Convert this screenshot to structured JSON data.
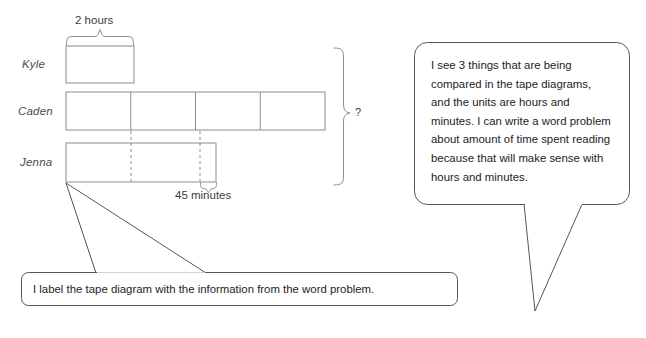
{
  "diagram": {
    "title_hidden": "",
    "rows": [
      {
        "name": "Kyle",
        "label": "Kyle"
      },
      {
        "name": "Caden",
        "label": "Caden"
      },
      {
        "name": "Jenna",
        "label": "Jenna"
      }
    ],
    "measures": {
      "two_hours": "2 hours",
      "forty_five_minutes": "45 minutes",
      "unknown_total": "?"
    },
    "segments": {
      "kyle_parts": 1,
      "caden_parts": 4,
      "jenna_dashed_marks": 2
    },
    "colors": {
      "stroke": "#8c8c8c",
      "bubble_stroke": "#444444",
      "text": "#232323",
      "label_text": "#4a4a4a",
      "background": "#ffffff"
    }
  },
  "callouts": {
    "right_bubble": {
      "text": "I see 3 things that are being compared in the tape diagrams, and the units are hours and minutes.  I can write a word problem about amount of time spent reading because that will make sense with hours and minutes."
    },
    "bottom_bubble": {
      "text": "I label the tape diagram with the information from the word problem."
    }
  }
}
